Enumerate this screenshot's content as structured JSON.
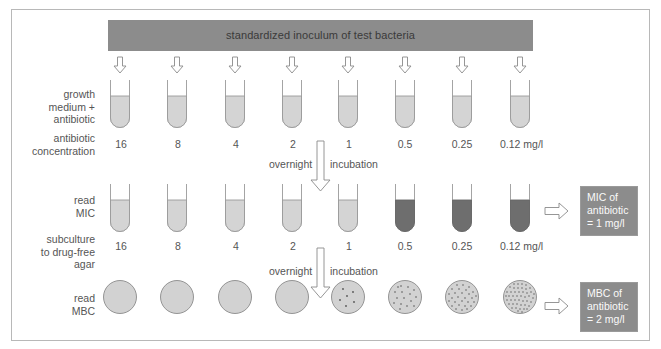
{
  "diagram": {
    "banner": "standardized inoculum of test bacteria",
    "row_labels": {
      "growth_medium": [
        "growth",
        "medium +",
        "antibiotic"
      ],
      "antibiotic_concentration": [
        "antibiotic",
        "concentration"
      ],
      "read_mic": [
        "read",
        "MIC"
      ],
      "subculture": [
        "subculture",
        "to drug-free",
        "agar"
      ],
      "read_mbc": [
        "read",
        "MBC"
      ]
    },
    "concentrations": [
      "16",
      "8",
      "4",
      "2",
      "1",
      "0.5",
      "0.25",
      "0.12 mg/l"
    ],
    "incubation_step": {
      "left": "overnight",
      "right": "incubation"
    },
    "mic_tubes_turbid": [
      false,
      false,
      false,
      false,
      false,
      true,
      true,
      true
    ],
    "mbc_colony_density": [
      "none",
      "none",
      "none",
      "none",
      "sparse",
      "moderate",
      "dense",
      "very dense"
    ],
    "mic_result": [
      "MIC of",
      "antibiotic",
      "= 1 mg/l"
    ],
    "mbc_result": [
      "MBC of",
      "antibiotic",
      "= 2 mg/l"
    ],
    "colors": {
      "banner": "#8c8c8c",
      "clear_medium": "#d4d4d4",
      "turbid_medium": "#6e6e6e",
      "agar": "#d2d2d2",
      "result_box": "#8c8c8c",
      "frame": "#b8b8b8"
    }
  }
}
